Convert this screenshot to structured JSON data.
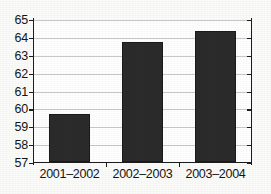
{
  "chart_data": {
    "type": "bar",
    "title": "",
    "subtitle": "",
    "xlabel": "",
    "ylabel": "",
    "categories": [
      "2001–2002",
      "2002–2003",
      "2003–2004"
    ],
    "values": [
      59.7,
      63.7,
      64.35
    ],
    "series": [
      {
        "name": "",
        "values": [
          59.7,
          63.7,
          64.35
        ]
      }
    ],
    "ylim": [
      57,
      65
    ],
    "yticks": [
      57,
      58,
      59,
      60,
      61,
      62,
      63,
      64,
      65
    ],
    "ytick_labels": [
      "57",
      "58",
      "59",
      "60",
      "61",
      "62",
      "63",
      "64",
      "65"
    ],
    "grid": true,
    "grid_axis": "y",
    "legend": false,
    "legend_position": "none",
    "annotations": [],
    "bar_color": "#2b2b2b",
    "grid_color": "#c9c9c9",
    "axis_color": "#1d1d1d",
    "plot_background": "#ffffff",
    "figure_background": "#fbfbfa"
  }
}
